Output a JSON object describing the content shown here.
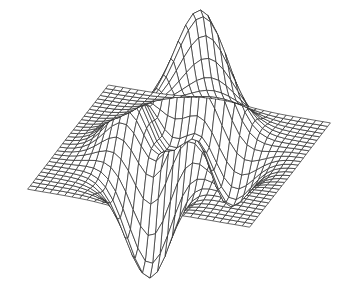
{
  "chart_data": {
    "type": "surface",
    "style": "wireframe-mesh",
    "title": "",
    "xlabel": "",
    "ylabel": "",
    "zlabel": "",
    "function": "peaks",
    "grid": {
      "rows": 30,
      "cols": 30
    },
    "x_range": [
      -3,
      3
    ],
    "y_range": [
      -3,
      3
    ],
    "z_range_approx": [
      -6.5,
      8.1
    ],
    "axes_visible": false,
    "legend": null,
    "line_color": "#2a2a2a",
    "face_color": "#ffffff",
    "background": "#ffffff"
  }
}
